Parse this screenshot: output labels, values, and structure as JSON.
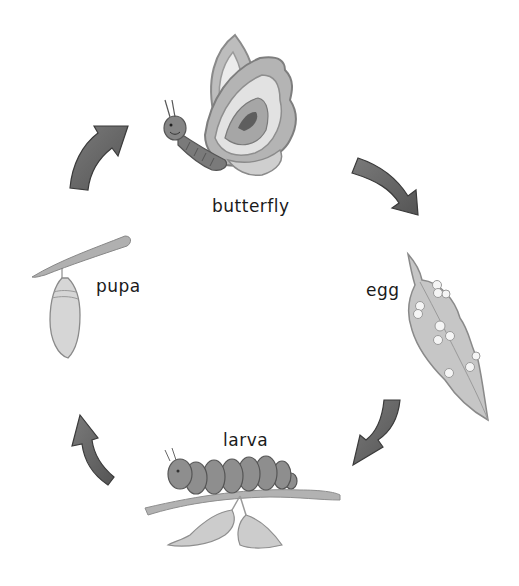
{
  "diagram": {
    "type": "life-cycle",
    "subject": "butterfly",
    "stages": [
      {
        "id": "butterfly",
        "label": "butterfly"
      },
      {
        "id": "egg",
        "label": "egg"
      },
      {
        "id": "larva",
        "label": "larva"
      },
      {
        "id": "pupa",
        "label": "pupa"
      }
    ],
    "flow": [
      "butterfly",
      "egg",
      "larva",
      "pupa",
      "butterfly"
    ],
    "direction": "clockwise"
  },
  "colors": {
    "arrow": "#6b6b6b",
    "arrow_edge": "#3a3a3a",
    "wing_outer": "#a8a8a8",
    "wing_light": "#e4e4e4",
    "wing_spot": "#5e5e5e",
    "body": "#7a7a7a",
    "leaf": "#c4c4c4",
    "branch": "#9a9a9a",
    "caterpillar": "#8a8a8a",
    "pupa": "#d2d2d2",
    "text": "#1a1a1a"
  }
}
